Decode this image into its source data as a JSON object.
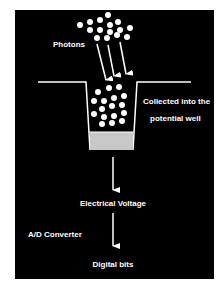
{
  "diagram": {
    "colors": {
      "background": "#000000",
      "foreground": "#ffffff",
      "well_fill": "#c8c8c8",
      "page": "#ffffff"
    },
    "labels": {
      "photons": "Photons",
      "collected_line1": "Collected into the",
      "collected_line2": "potential well",
      "voltage": "Electrical Voltage",
      "converter": "A/D Converter",
      "bits": "Digital bits"
    },
    "photons_top": [
      [
        108,
        15
      ],
      [
        80,
        25
      ],
      [
        90,
        22
      ],
      [
        100,
        20
      ],
      [
        110,
        25
      ],
      [
        118,
        22
      ],
      [
        90,
        30
      ],
      [
        100,
        30
      ],
      [
        110,
        32
      ],
      [
        120,
        30
      ],
      [
        130,
        28
      ],
      [
        97,
        38
      ],
      [
        107,
        38
      ],
      [
        117,
        35
      ],
      [
        127,
        37
      ]
    ],
    "photons_well": [
      [
        98,
        92
      ],
      [
        109,
        88
      ],
      [
        119,
        87
      ],
      [
        94,
        101
      ],
      [
        104,
        101
      ],
      [
        114,
        98
      ],
      [
        124,
        96
      ],
      [
        102,
        109
      ],
      [
        112,
        106
      ],
      [
        122,
        105
      ],
      [
        94,
        114
      ],
      [
        104,
        117
      ],
      [
        114,
        116
      ],
      [
        124,
        113
      ],
      [
        102,
        124
      ],
      [
        112,
        123
      ],
      [
        122,
        121
      ]
    ],
    "photon_arrows": [
      [
        [
          97,
          44
        ],
        [
          106,
          80
        ]
      ],
      [
        [
          108,
          45
        ],
        [
          114,
          76
        ]
      ],
      [
        [
          120,
          42
        ],
        [
          126,
          74
        ]
      ]
    ],
    "flow_arrows": [
      [
        [
          113,
          157
        ],
        [
          113,
          190
        ]
      ],
      [
        [
          113,
          213
        ],
        [
          113,
          246
        ]
      ]
    ]
  }
}
